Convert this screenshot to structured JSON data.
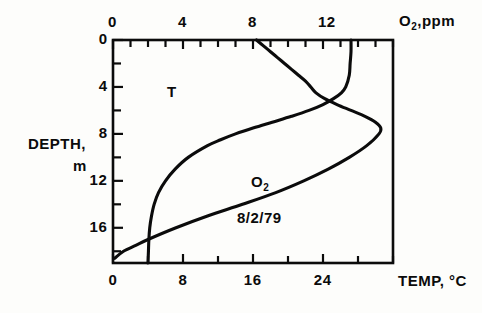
{
  "figure": {
    "kind": "depth-profile",
    "annotations": {
      "temperature_tag": "T",
      "oxygen_tag_base": "O",
      "oxygen_tag_sub": "2",
      "date": "8/2/79"
    },
    "axis_titles": {
      "top_base": "O",
      "top_sub": "2",
      "top_rest": ",ppm",
      "bottom": "TEMP, °C",
      "left_line1": "DEPTH,",
      "left_line2": "m"
    }
  },
  "chart_data": {
    "type": "line",
    "title": "",
    "subtitle": "8/2/79",
    "orientation": "vertical-depth-profile",
    "grid": false,
    "legend": "inline-labels",
    "frame_px": {
      "left": 113,
      "right": 393,
      "top": 40,
      "bottom": 263
    },
    "axes": {
      "depth": {
        "label": "DEPTH, m",
        "position": "left",
        "direction": "down",
        "lim": [
          0,
          19
        ],
        "ticks": [
          0,
          4,
          8,
          12,
          16
        ],
        "tick_labels": [
          "0",
          "4",
          "8",
          "12",
          "16"
        ],
        "minor_tick_step": 2
      },
      "oxygen": {
        "label": "O2 ,ppm",
        "position": "top",
        "lim": [
          0,
          16
        ],
        "ticks": [
          0,
          4,
          8,
          12
        ],
        "tick_labels": [
          "0",
          "4",
          "8",
          "12"
        ],
        "minor_tick_step": 1
      },
      "temperature": {
        "label": "TEMP, °C",
        "position": "bottom",
        "lim": [
          0,
          32
        ],
        "ticks": [
          0,
          8,
          16,
          24
        ],
        "tick_labels": [
          "0",
          "8",
          "16",
          "24"
        ],
        "minor_tick_step": 4
      }
    },
    "series": [
      {
        "name": "O2",
        "label": "O2",
        "units": "ppm",
        "axis": "oxygen",
        "color": "#000000",
        "depth_m": [
          0,
          0.5,
          1,
          1.5,
          2,
          2.5,
          3,
          3.5,
          4,
          4.5,
          5,
          5.5,
          6,
          6.5,
          7,
          7.5,
          8,
          9,
          10,
          11,
          12,
          13,
          14,
          15,
          16,
          17,
          17.5,
          18,
          18.6
        ],
        "values_ppm": [
          8.2,
          8.6,
          9.0,
          9.4,
          9.8,
          10.2,
          10.6,
          11.0,
          11.3,
          11.6,
          12.1,
          12.8,
          13.6,
          14.4,
          15.0,
          15.3,
          15.2,
          14.5,
          13.5,
          12.3,
          10.9,
          9.3,
          7.4,
          5.4,
          3.6,
          2.0,
          1.3,
          0.6,
          0.1
        ]
      },
      {
        "name": "T",
        "label": "T",
        "units": "°C",
        "axis": "temperature",
        "color": "#000000",
        "depth_m": [
          0,
          1,
          2,
          3,
          4,
          4.5,
          5,
          5.5,
          6,
          6.5,
          7,
          7.5,
          8,
          8.5,
          9,
          10,
          11,
          12,
          13,
          14,
          15,
          16,
          17,
          18,
          19
        ],
        "values_c": [
          27.2,
          27.2,
          27.1,
          27.0,
          26.6,
          26.1,
          25.2,
          24.0,
          22.4,
          20.4,
          18.2,
          16.0,
          14.0,
          12.3,
          10.8,
          8.6,
          7.1,
          6.0,
          5.2,
          4.7,
          4.4,
          4.2,
          4.1,
          4.05,
          4.0
        ]
      }
    ],
    "notes": [
      "O2 curve crosses T curve near depth 5 m",
      "O2 maximum ~15.3 ppm near depth 7.5 m",
      "O2 approaches 0 ppm at depth ~18.6 m",
      "Thermocline between 4 m and 9 m"
    ]
  },
  "tick_labels": {
    "top": [
      "0",
      "4",
      "8",
      "12"
    ],
    "bottom": [
      "0",
      "8",
      "16",
      "24"
    ],
    "left": [
      "0",
      "4",
      "8",
      "12",
      "16"
    ]
  }
}
